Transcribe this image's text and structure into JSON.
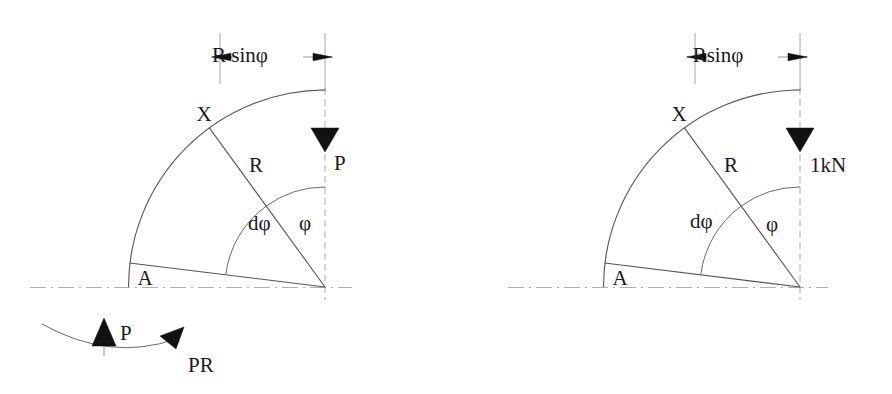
{
  "figure": {
    "background_color": "#ffffff",
    "line_color": "#4a4a4a",
    "arrow_fill_color": "#111111",
    "text_color": "#1a1a1a",
    "centerline_color": "#9a9a9a"
  },
  "left_diagram": {
    "name": "left-curved-bar",
    "dimension_label": "R sinφ",
    "point_x_label": "X",
    "point_a_label": "A",
    "radius_label": "R",
    "angle_dphi_label": "dφ",
    "angle_phi_label": "φ",
    "load_label": "P",
    "reaction_force_label": "P",
    "moment_label": "PR",
    "geometry": {
      "center_x": 325,
      "center_y": 287,
      "radius": 197,
      "phi_degrees": 36,
      "dphi_degrees": 47
    }
  },
  "right_diagram": {
    "name": "right-curved-bar",
    "dimension_label": "Rsinφ",
    "point_x_label": "X",
    "point_a_label": "A",
    "radius_label": "R",
    "angle_dphi_label": "dφ",
    "angle_phi_label": "φ",
    "load_label": "1kN",
    "geometry": {
      "center_x": 800,
      "center_y": 287,
      "radius": 197,
      "phi_degrees": 36,
      "dphi_degrees": 47
    }
  }
}
